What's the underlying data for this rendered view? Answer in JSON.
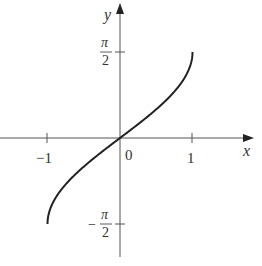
{
  "chart_data": {
    "type": "line",
    "title": "",
    "function": "y = arcsin(x)",
    "xlabel": "x",
    "ylabel": "y",
    "xlim": [
      -1.65,
      1.85
    ],
    "ylim": [
      -2.15,
      2.5
    ],
    "grid": false,
    "legend": null,
    "x_ticks": [
      {
        "value": -1,
        "label": "−1"
      },
      {
        "value": 0,
        "label": "0"
      },
      {
        "value": 1,
        "label": "1"
      }
    ],
    "y_ticks": [
      {
        "value": 1.5708,
        "label_num": "π",
        "label_den": "2",
        "sign": ""
      },
      {
        "value": -1.5708,
        "label_num": "π",
        "label_den": "2",
        "sign": "−"
      }
    ],
    "series": [
      {
        "name": "arcsin",
        "x": [
          -1,
          -0.99,
          -0.95,
          -0.9,
          -0.8,
          -0.7,
          -0.6,
          -0.5,
          -0.4,
          -0.3,
          -0.2,
          -0.1,
          0,
          0.1,
          0.2,
          0.3,
          0.4,
          0.5,
          0.6,
          0.7,
          0.8,
          0.9,
          0.95,
          0.99,
          1
        ],
        "y": [
          -1.5708,
          -1.4293,
          -1.2532,
          -1.1198,
          -0.9273,
          -0.7754,
          -0.6435,
          -0.5236,
          -0.4115,
          -0.3047,
          -0.2014,
          -0.1002,
          0,
          0.1002,
          0.2014,
          0.3047,
          0.4115,
          0.5236,
          0.6435,
          0.7754,
          0.9273,
          1.1198,
          1.2532,
          1.4293,
          1.5708
        ]
      }
    ]
  },
  "labels": {
    "x_axis": "x",
    "y_axis": "y",
    "origin": "0",
    "tick_neg1": "−1",
    "tick_pos1": "1",
    "pi": "π",
    "two": "2",
    "minus": "−"
  },
  "colors": {
    "axis": "#555555",
    "curve": "#222222",
    "text": "#333333"
  }
}
